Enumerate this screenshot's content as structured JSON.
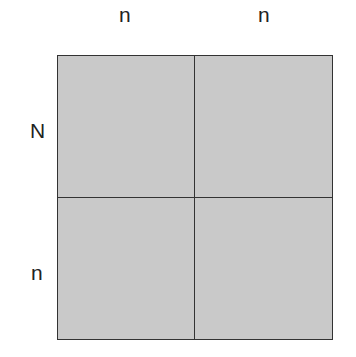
{
  "diagram": {
    "type": "punnett-square",
    "column_alleles": [
      "n",
      "n"
    ],
    "row_alleles": [
      "N",
      "n"
    ],
    "cells": [
      [
        "",
        ""
      ],
      [
        "",
        ""
      ]
    ],
    "fill_color": "#c9c9c9",
    "border_color": "#333333"
  }
}
